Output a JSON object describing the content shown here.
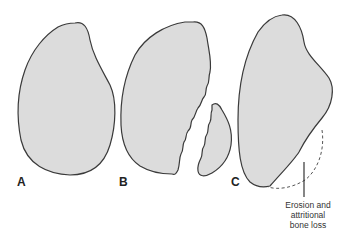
{
  "figure": {
    "panels": [
      {
        "label": "A",
        "description": "intact bone outline"
      },
      {
        "label": "B",
        "description": "fractured bone with separated fragment"
      },
      {
        "label": "C",
        "description": "bone with eroded region"
      }
    ],
    "annotation": {
      "lines": [
        "Erosion and",
        "attritional",
        "bone loss"
      ]
    },
    "colors": {
      "fill": "#dcdcdc",
      "stroke": "#3a3a3a"
    }
  }
}
